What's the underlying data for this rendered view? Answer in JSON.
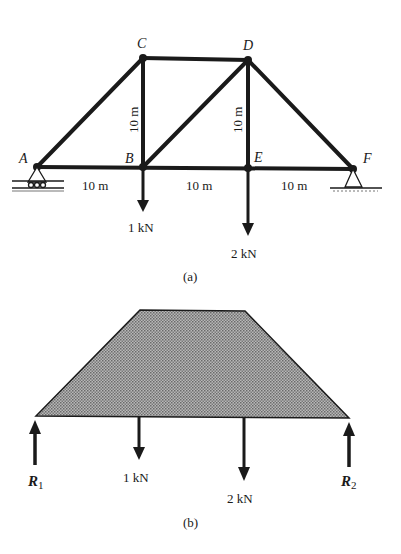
{
  "figure_a": {
    "caption": "(a)",
    "nodes": {
      "A": {
        "label": "A"
      },
      "B": {
        "label": "B"
      },
      "C": {
        "label": "C"
      },
      "D": {
        "label": "D"
      },
      "E": {
        "label": "E"
      },
      "F": {
        "label": "F"
      }
    },
    "dimensions": {
      "AB": "10 m",
      "BE": "10 m",
      "EF": "10 m",
      "BC": "10 m",
      "ED": "10 m"
    },
    "loads": {
      "B": "1 kN",
      "E": "2 kN"
    }
  },
  "figure_b": {
    "caption": "(b)",
    "reactions": {
      "R1": "R",
      "R1_sub": "1",
      "R2": "R",
      "R2_sub": "2"
    },
    "loads": {
      "first": "1 kN",
      "second": "2 kN"
    }
  },
  "colors": {
    "ink": "#1a1a1a",
    "hatch_fill": "#8a8a8a"
  }
}
